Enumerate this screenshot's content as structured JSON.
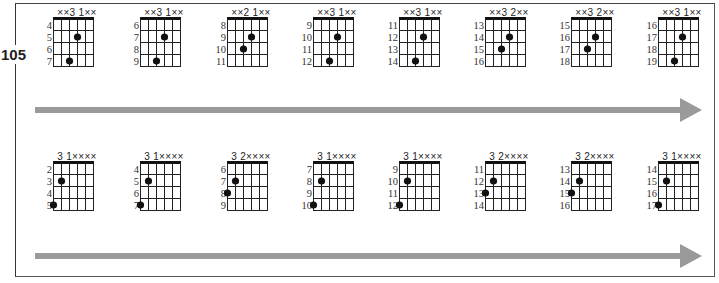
{
  "page_number": "105",
  "arrow_color": "#9a9a9a",
  "rows": [
    {
      "chords": [
        {
          "label": "××3 1××",
          "frets": [
            "4",
            "5",
            "6",
            "7"
          ],
          "dots": [
            {
              "string": 4,
              "fret": 2
            },
            {
              "string": 3,
              "fret": 4
            }
          ]
        },
        {
          "label": "××3 1××",
          "frets": [
            "6",
            "7",
            "8",
            "9"
          ],
          "dots": [
            {
              "string": 4,
              "fret": 2
            },
            {
              "string": 3,
              "fret": 4
            }
          ]
        },
        {
          "label": "××2 1××",
          "frets": [
            "8",
            "9",
            "10",
            "11"
          ],
          "dots": [
            {
              "string": 4,
              "fret": 2
            },
            {
              "string": 3,
              "fret": 3
            }
          ]
        },
        {
          "label": "××3 1××",
          "frets": [
            "9",
            "10",
            "11",
            "12"
          ],
          "dots": [
            {
              "string": 4,
              "fret": 2
            },
            {
              "string": 3,
              "fret": 4
            }
          ]
        },
        {
          "label": "××3 1××",
          "frets": [
            "11",
            "12",
            "13",
            "14"
          ],
          "dots": [
            {
              "string": 4,
              "fret": 2
            },
            {
              "string": 3,
              "fret": 4
            }
          ]
        },
        {
          "label": "××3 2××",
          "frets": [
            "13",
            "14",
            "15",
            "16"
          ],
          "dots": [
            {
              "string": 4,
              "fret": 2
            },
            {
              "string": 3,
              "fret": 3
            }
          ]
        },
        {
          "label": "××3 2××",
          "frets": [
            "15",
            "16",
            "17",
            "18"
          ],
          "dots": [
            {
              "string": 4,
              "fret": 2
            },
            {
              "string": 3,
              "fret": 3
            }
          ]
        },
        {
          "label": "××3 1××",
          "frets": [
            "16",
            "17",
            "18",
            "19"
          ],
          "dots": [
            {
              "string": 4,
              "fret": 2
            },
            {
              "string": 3,
              "fret": 4
            }
          ]
        }
      ]
    },
    {
      "chords": [
        {
          "label": "3 1××××",
          "frets": [
            "2",
            "3",
            "4",
            "5"
          ],
          "dots": [
            {
              "string": 2,
              "fret": 2
            },
            {
              "string": 1,
              "fret": 4
            }
          ]
        },
        {
          "label": "3 1××××",
          "frets": [
            "4",
            "5",
            "6",
            "7"
          ],
          "dots": [
            {
              "string": 2,
              "fret": 2
            },
            {
              "string": 1,
              "fret": 4
            }
          ]
        },
        {
          "label": "3 2××××",
          "frets": [
            "6",
            "7",
            "8",
            "9"
          ],
          "dots": [
            {
              "string": 2,
              "fret": 2
            },
            {
              "string": 1,
              "fret": 3
            }
          ]
        },
        {
          "label": "3 1××××",
          "frets": [
            "7",
            "8",
            "9",
            "10"
          ],
          "dots": [
            {
              "string": 2,
              "fret": 2
            },
            {
              "string": 1,
              "fret": 4
            }
          ]
        },
        {
          "label": "3 1××××",
          "frets": [
            "9",
            "10",
            "11",
            "12"
          ],
          "dots": [
            {
              "string": 2,
              "fret": 2
            },
            {
              "string": 1,
              "fret": 4
            }
          ]
        },
        {
          "label": "3 2××××",
          "frets": [
            "11",
            "12",
            "13",
            "14"
          ],
          "dots": [
            {
              "string": 2,
              "fret": 2
            },
            {
              "string": 1,
              "fret": 3
            }
          ]
        },
        {
          "label": "3 2××××",
          "frets": [
            "13",
            "14",
            "15",
            "16"
          ],
          "dots": [
            {
              "string": 2,
              "fret": 2
            },
            {
              "string": 1,
              "fret": 3
            }
          ]
        },
        {
          "label": "3 1××××",
          "frets": [
            "14",
            "15",
            "16",
            "17"
          ],
          "dots": [
            {
              "string": 2,
              "fret": 2
            },
            {
              "string": 1,
              "fret": 4
            }
          ]
        }
      ]
    }
  ]
}
